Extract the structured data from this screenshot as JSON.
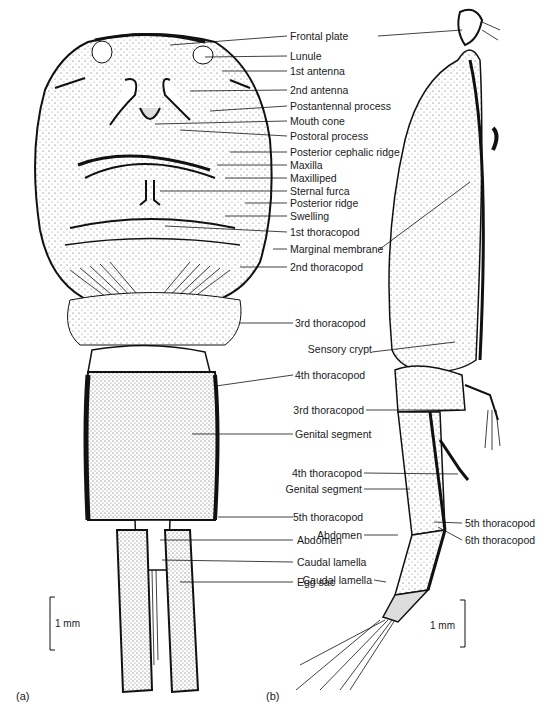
{
  "figure": {
    "panels": [
      {
        "id": "a",
        "caption": "(a)",
        "view": "ventral"
      },
      {
        "id": "b",
        "caption": "(b)",
        "view": "lateral"
      }
    ],
    "scale_bars": [
      {
        "panel": "a",
        "label": "1 mm"
      },
      {
        "panel": "b",
        "label": "1 mm"
      }
    ],
    "labels_a": [
      "Frontal plate",
      "Lunule",
      "1st antenna",
      "2nd antenna",
      "Postantennal process",
      "Mouth cone",
      "Postoral process",
      "Posterior cephalic ridge",
      "Maxilla",
      "Maxilliped",
      "Sternal furca",
      "Posterior ridge",
      "Swelling",
      "1st thoracopod",
      "Marginal membrane",
      "2nd thoracopod",
      "3rd thoracopod",
      "4th thoracopod",
      "Genital segment",
      "5th thoracopod",
      "Abdomen",
      "Caudal lamella",
      "Egg sac"
    ],
    "labels_b": [
      "Sensory crypt",
      "3rd thoracopod",
      "4th thoracopod",
      "Genital segment",
      "Abdomen",
      "Caudal lamella",
      "5th thoracopod",
      "6th thoracopod"
    ]
  }
}
